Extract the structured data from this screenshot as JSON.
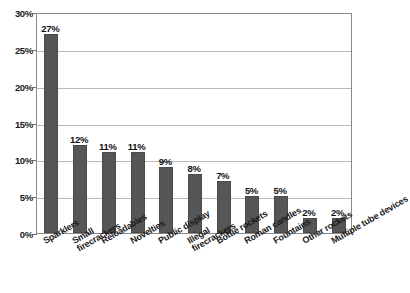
{
  "chart_data": {
    "type": "bar",
    "title": "",
    "subtitle": "",
    "xlabel": "",
    "ylabel": "",
    "ylim": [
      0,
      30
    ],
    "ytick_values": [
      0,
      5,
      10,
      15,
      20,
      25,
      30
    ],
    "ytick_labels": [
      "0%",
      "5%",
      "10%",
      "15%",
      "20%",
      "25%",
      "30%"
    ],
    "grid": true,
    "legend": "none",
    "orientation": "vertical",
    "bar_color": "#565656",
    "gridline_color": "#b9b9b9",
    "axis_color": "#6e6e6e",
    "label_color": "#1a1a1a",
    "categories": [
      "Sparklers",
      "Small firecrackers",
      "Reloadables",
      "Novelties",
      "Public display",
      "Illegal firecrackers",
      "Bottle rockets",
      "Roman candles",
      "Fountains",
      "Other rockets",
      "Multiple tube devices"
    ],
    "category_lines": [
      [
        "Sparklers"
      ],
      [
        "Small",
        "firecrackers"
      ],
      [
        "Reloadables"
      ],
      [
        "Novelties"
      ],
      [
        "Public display"
      ],
      [
        "Illegal",
        "firecrackers"
      ],
      [
        "Bottle rockets"
      ],
      [
        "Roman candles"
      ],
      [
        "Fountains"
      ],
      [
        "Other rockets"
      ],
      [
        "Multiple tube devices"
      ]
    ],
    "values": [
      27,
      12,
      11,
      11,
      9,
      8,
      7,
      5,
      5,
      2,
      2
    ],
    "value_labels": [
      "27%",
      "12%",
      "11%",
      "11%",
      "9%",
      "8%",
      "7%",
      "5%",
      "5%",
      "2%",
      "2%"
    ]
  }
}
